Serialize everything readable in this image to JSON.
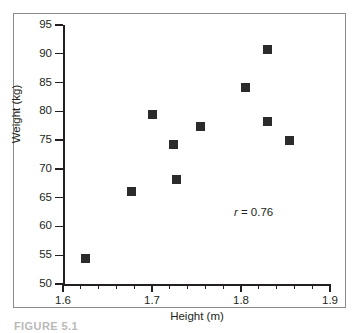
{
  "figure": {
    "caption": "FIGURE 5.1"
  },
  "chart_data": {
    "type": "scatter",
    "title": "",
    "xlabel": "Height (m)",
    "ylabel": "Weight (kg)",
    "xlim": [
      1.6,
      1.9
    ],
    "ylim": [
      50,
      95
    ],
    "xticks": [
      1.6,
      1.7,
      1.8,
      1.9
    ],
    "xtick_labels": [
      "1.6",
      "1.7",
      "1.8",
      "1.9"
    ],
    "xminor_step": 0.02,
    "yticks": [
      50,
      55,
      60,
      65,
      70,
      75,
      80,
      85,
      90,
      95
    ],
    "ytick_labels": [
      "50",
      "55",
      "60",
      "65",
      "70",
      "75",
      "80",
      "85",
      "90",
      "95"
    ],
    "grid": false,
    "legend": null,
    "marker": "square",
    "marker_color": "#2b2b2b",
    "x": [
      1.625,
      1.677,
      1.701,
      1.724,
      1.727,
      1.755,
      1.805,
      1.83,
      1.83,
      1.855
    ],
    "y": [
      54.5,
      66.1,
      79.5,
      74.2,
      68.2,
      77.3,
      84.2,
      90.7,
      78.2,
      75.0
    ],
    "points": [
      {
        "x": 1.625,
        "y": 54.5
      },
      {
        "x": 1.677,
        "y": 66.1
      },
      {
        "x": 1.701,
        "y": 79.5
      },
      {
        "x": 1.724,
        "y": 74.2
      },
      {
        "x": 1.727,
        "y": 68.2
      },
      {
        "x": 1.755,
        "y": 77.3
      },
      {
        "x": 1.805,
        "y": 84.2
      },
      {
        "x": 1.83,
        "y": 90.7
      },
      {
        "x": 1.83,
        "y": 78.2
      },
      {
        "x": 1.855,
        "y": 75.0
      }
    ],
    "annotations": [
      {
        "name": "correlation",
        "symbol": "r",
        "text": " = 0.76",
        "full_text": "r = 0.76",
        "value": 0.76,
        "x": 1.792,
        "y": 62.3
      }
    ]
  }
}
